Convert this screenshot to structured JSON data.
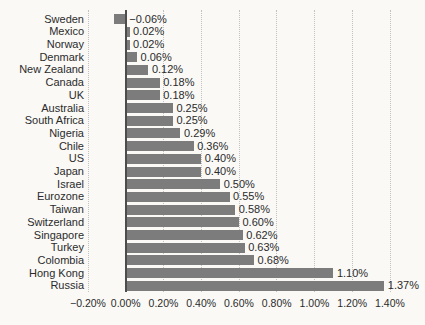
{
  "chart_data": {
    "type": "bar",
    "orientation": "horizontal",
    "title": "",
    "xlabel": "",
    "ylabel": "",
    "categories": [
      "Sweden",
      "Mexico",
      "Norway",
      "Denmark",
      "New Zealand",
      "Canada",
      "UK",
      "Australia",
      "South Africa",
      "Nigeria",
      "Chile",
      "US",
      "Japan",
      "Israel",
      "Eurozone",
      "Taiwan",
      "Switzerland",
      "Singapore",
      "Turkey",
      "Colombia",
      "Hong Kong",
      "Russia"
    ],
    "values": [
      -0.06,
      0.02,
      0.02,
      0.06,
      0.12,
      0.18,
      0.18,
      0.25,
      0.25,
      0.29,
      0.36,
      0.4,
      0.4,
      0.5,
      0.55,
      0.58,
      0.6,
      0.62,
      0.63,
      0.68,
      1.1,
      1.37
    ],
    "value_labels": [
      "−0.06%",
      "0.02%",
      "0.02%",
      "0.06%",
      "0.12%",
      "0.18%",
      "0.18%",
      "0.25%",
      "0.25%",
      "0.29%",
      "0.36%",
      "0.40%",
      "0.40%",
      "0.50%",
      "0.55%",
      "0.58%",
      "0.60%",
      "0.62%",
      "0.63%",
      "0.68%",
      "1.10%",
      "1.37%"
    ],
    "xlim": [
      -0.2,
      1.4
    ],
    "x_ticks": [
      -0.2,
      0.0,
      0.2,
      0.4,
      0.6,
      0.8,
      1.0,
      1.2,
      1.4
    ],
    "x_tick_labels": [
      "−0.20%",
      "0.00%",
      "0.20%",
      "0.40%",
      "0.60%",
      "0.80%",
      "1.00%",
      "1.20%",
      "1.40%"
    ],
    "grid": "vertical-dotted",
    "legend": "none",
    "colors": {
      "bar": "#7c7c7c",
      "grid": "#c2c2c2",
      "zero_axis": "#4d4d4d",
      "text": "#2b2b2b",
      "background": "#faf9f6"
    }
  }
}
